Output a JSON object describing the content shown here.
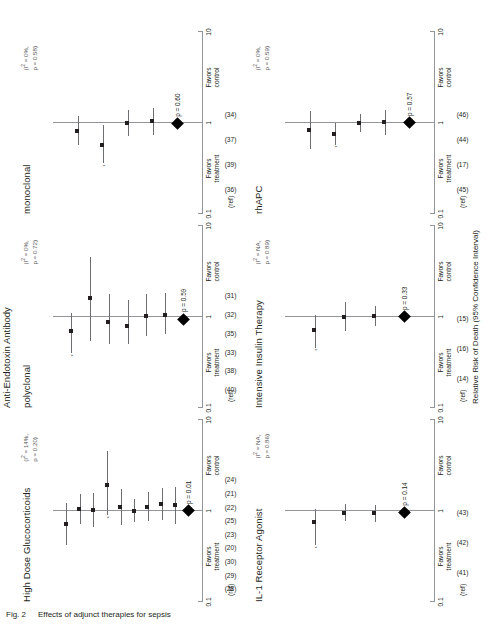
{
  "figure": {
    "caption_label": "Fig. 2",
    "caption_text": "Effects of adjunct therapies for sepsis",
    "axis_caption": "Relative Risk of Death (95% Confidence Interval)",
    "ref_header": "(ref)"
  },
  "axis": {
    "ticks": [
      "0.1",
      "1",
      "10"
    ],
    "favors_treatment": "Favors\ntreatment",
    "favors_control": "Favors\ncontrol",
    "favors_treatment_l1": "Favors",
    "favors_treatment_l2": "treatment",
    "favors_control_l1": "Favors",
    "favors_control_l2": "control"
  },
  "group_titles": {
    "anti_endotoxin": "Anti-Endotoxin Antibody"
  },
  "chart_data": {
    "type": "forest",
    "title": "Effects of adjunct therapies for sepsis",
    "xlabel": "Relative Risk of Death (95% Confidence Interval)",
    "xscale": "log",
    "xlim": [
      0.1,
      10
    ],
    "xticks": [
      0.1,
      1,
      10
    ],
    "null_value": 1,
    "panels": [
      {
        "name": "high-dose-glucocorticoids",
        "title": "High Dose Glucocorticoids",
        "heterogeneity_i2": "(I 2 = 14%,",
        "heterogeneity_p": "p = 0.20)",
        "pooled_p": "p = 0.01",
        "pooled_rr": 1.0,
        "studies": [
          {
            "ref": "(28)",
            "rr": 0.72,
            "lo": 0.42,
            "hi": 1.22,
            "truncated": false
          },
          {
            "ref": "(29)",
            "rr": 1.05,
            "lo": 0.72,
            "hi": 1.55,
            "truncated": false
          },
          {
            "ref": "(30)",
            "rr": 1.02,
            "lo": 0.66,
            "hi": 1.58,
            "truncated": false
          },
          {
            "ref": "(20)",
            "rr": 1.95,
            "lo": 0.9,
            "hi": 4.6,
            "truncated": true
          },
          {
            "ref": "(23)",
            "rr": 1.1,
            "lo": 0.7,
            "hi": 1.75,
            "truncated": false
          },
          {
            "ref": "(25)",
            "rr": 1.0,
            "lo": 0.75,
            "hi": 1.35,
            "truncated": false
          },
          {
            "ref": "(22)",
            "rr": 1.12,
            "lo": 0.78,
            "hi": 1.6,
            "truncated": false
          },
          {
            "ref": "(21)",
            "rr": 1.2,
            "lo": 0.8,
            "hi": 1.8,
            "truncated": false
          },
          {
            "ref": "(24)",
            "rr": 1.15,
            "lo": 0.72,
            "hi": 1.85,
            "truncated": false
          }
        ]
      },
      {
        "name": "anti-endotoxin-polyclonal",
        "title": "polyclonal",
        "group": "Anti-Endotoxin Antibody",
        "heterogeneity_i2": "(I 2 = 0%,",
        "heterogeneity_p": "p = 0.72)",
        "pooled_p": "p = 0.59",
        "pooled_rr": 0.95,
        "studies": [
          {
            "ref": "(40)",
            "rr": 0.7,
            "lo": 0.4,
            "hi": 1.1,
            "truncated": true
          },
          {
            "ref": "(38)",
            "rr": 1.6,
            "lo": 0.55,
            "hi": 4.6,
            "truncated": false
          },
          {
            "ref": "(33)",
            "rr": 0.88,
            "lo": 0.5,
            "hi": 1.8,
            "truncated": false
          },
          {
            "ref": "(35)",
            "rr": 0.8,
            "lo": 0.5,
            "hi": 1.55,
            "truncated": false
          },
          {
            "ref": "(32)",
            "rr": 1.02,
            "lo": 0.62,
            "hi": 1.8,
            "truncated": false
          },
          {
            "ref": "(31)",
            "rr": 1.05,
            "lo": 0.65,
            "hi": 1.85,
            "truncated": false
          }
        ]
      },
      {
        "name": "anti-endotoxin-monoclonal",
        "title": "monoclonal",
        "group": "Anti-Endotoxin Antibody",
        "heterogeneity_i2": "(I 2 = 0%,",
        "heterogeneity_p": "p = 0.58)",
        "pooled_p": "p = 0.60",
        "pooled_rr": 0.98,
        "studies": [
          {
            "ref": "(36)",
            "rr": 0.82,
            "lo": 0.58,
            "hi": 1.18,
            "truncated": false
          },
          {
            "ref": "(39)",
            "rr": 0.58,
            "lo": 0.36,
            "hi": 0.95,
            "truncated": true
          },
          {
            "ref": "(37)",
            "rr": 1.0,
            "lo": 0.72,
            "hi": 1.38,
            "truncated": false
          },
          {
            "ref": "(34)",
            "rr": 1.05,
            "lo": 0.74,
            "hi": 1.48,
            "truncated": false
          }
        ]
      },
      {
        "name": "il-1-receptor-agonist",
        "title": "IL-1 Receptor Agonist",
        "heterogeneity_i2": "(I 2 = NA,",
        "heterogeneity_p": "p = 0.86)",
        "pooled_p": "p = 0.14",
        "pooled_rr": 0.96,
        "studies": [
          {
            "ref": "(41)",
            "rr": 0.75,
            "lo": 0.42,
            "hi": 1.05,
            "truncated": true
          },
          {
            "ref": "(42)",
            "rr": 0.96,
            "lo": 0.78,
            "hi": 1.18,
            "truncated": false
          },
          {
            "ref": "(43)",
            "rr": 0.94,
            "lo": 0.76,
            "hi": 1.16,
            "truncated": false
          }
        ]
      },
      {
        "name": "intensive-insulin-therapy",
        "title": "Intensive Insulin Therapy",
        "heterogeneity_i2": "(I 2 = NA,",
        "heterogeneity_p": "p = 0.89)",
        "pooled_p": "p = 0.33",
        "pooled_rr": 1.0,
        "studies": [
          {
            "ref": "(14)",
            "rr": 0.72,
            "lo": 0.46,
            "hi": 1.05,
            "truncated": true
          },
          {
            "ref": "(16)",
            "rr": 1.0,
            "lo": 0.7,
            "hi": 1.45,
            "truncated": false
          },
          {
            "ref": "(15)",
            "rr": 1.02,
            "lo": 0.8,
            "hi": 1.32,
            "truncated": false
          }
        ]
      },
      {
        "name": "rhapc",
        "title": "rhAPC",
        "heterogeneity_i2": "(I 2 = 0%,",
        "heterogeneity_p": "p = 0.59)",
        "pooled_p": "p = 0.57",
        "pooled_rr": 1.0,
        "studies": [
          {
            "ref": "(45)",
            "rr": 0.84,
            "lo": 0.52,
            "hi": 1.35,
            "truncated": false
          },
          {
            "ref": "(17)",
            "rr": 0.76,
            "lo": 0.58,
            "hi": 1.0,
            "truncated": true
          },
          {
            "ref": "(44)",
            "rr": 1.0,
            "lo": 0.8,
            "hi": 1.25,
            "truncated": false
          },
          {
            "ref": "(46)",
            "rr": 1.02,
            "lo": 0.74,
            "hi": 1.4,
            "truncated": false
          }
        ]
      }
    ]
  }
}
